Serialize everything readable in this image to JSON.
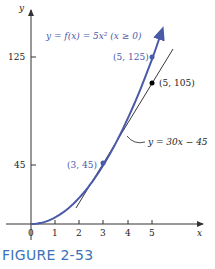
{
  "figure": {
    "caption": "FIGURE 2-53",
    "function_label": "y = f(x) = 5x²  (x ≥ 0)",
    "tangent_label": "y = 30x − 45",
    "axis_x_label": "x",
    "axis_y_label": "y",
    "colors": {
      "curve": "#4a5aa8",
      "tangent": "#222222",
      "axes": "#333333",
      "caption": "#3b73b9"
    }
  },
  "chart_data": {
    "type": "line",
    "title": "",
    "xlabel": "x",
    "ylabel": "y",
    "xlim": [
      0,
      5.8
    ],
    "ylim": [
      0,
      150
    ],
    "grid": false,
    "x_ticks": [
      "0",
      "1",
      "2",
      "3",
      "4",
      "5"
    ],
    "y_ticks": [
      "45",
      "125"
    ],
    "series": [
      {
        "name": "y = f(x) = 5x² (x ≥ 0)",
        "color": "#4a5aa8",
        "x": [
          0,
          0.5,
          1,
          1.5,
          2,
          2.5,
          3,
          3.5,
          4,
          4.5,
          5,
          5.4
        ],
        "values": [
          0,
          1.25,
          5,
          11.25,
          20,
          31.25,
          45,
          61.25,
          80,
          101.25,
          125,
          145.8
        ]
      },
      {
        "name": "y = 30x − 45",
        "color": "#222222",
        "x": [
          1.9,
          5.8
        ],
        "values": [
          12,
          129
        ]
      }
    ],
    "points": [
      {
        "label": "(3, 45)",
        "x": 3,
        "y": 45,
        "color": "#4a5aa8"
      },
      {
        "label": "(5, 125)",
        "x": 5,
        "y": 125,
        "color": "#4a5aa8"
      },
      {
        "label": "(5, 105)",
        "x": 5,
        "y": 105,
        "color": "#000000"
      }
    ],
    "annotations": [
      "y = f(x) = 5x²  (x ≥ 0)",
      "y = 30x − 45"
    ]
  }
}
